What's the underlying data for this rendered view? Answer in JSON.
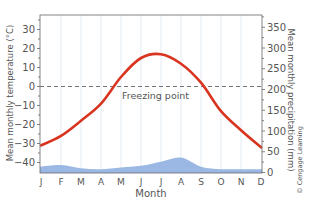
{
  "chart_data": {
    "type": "line",
    "title": "",
    "categories": [
      "J",
      "F",
      "M",
      "A",
      "M",
      "J",
      "J",
      "A",
      "S",
      "O",
      "N",
      "D"
    ],
    "xlabel": "Month",
    "ylabel_left": "Mean monthly temperature (°C)",
    "ylabel_right": "Mean monthly precipitation (mm)",
    "ylim_left": [
      -45,
      37
    ],
    "ylim_right": [
      0,
      375
    ],
    "yticks_left": [
      30,
      20,
      10,
      0,
      -10,
      -20,
      -30,
      -40
    ],
    "yticks_right": [
      350,
      300,
      250,
      200,
      150,
      100,
      50,
      0
    ],
    "grid": "vertical",
    "series": [
      {
        "name": "Mean monthly temperature",
        "axis": "left",
        "kind": "line",
        "color": "#d9341f",
        "values": [
          -31,
          -26,
          -18,
          -9,
          5,
          15,
          17,
          12,
          2,
          -13,
          -23,
          -32
        ]
      },
      {
        "name": "Mean monthly precipitation",
        "axis": "right",
        "kind": "area",
        "color": "#8fb0e0",
        "values": [
          14,
          18,
          10,
          8,
          12,
          16,
          26,
          36,
          14,
          8,
          8,
          8
        ]
      }
    ],
    "annotations": [
      {
        "text": "Freezing point",
        "type": "hline",
        "axis": "left",
        "y": 0,
        "style": "dashed"
      }
    ]
  },
  "labels": {
    "xlabel": "Month",
    "ylabel_left": "Mean monthly temperature (°C)",
    "ylabel_right": "Mean monthly precipitation (mm)",
    "freezing": "Freezing point",
    "copyright": "© Cengage Learning"
  }
}
